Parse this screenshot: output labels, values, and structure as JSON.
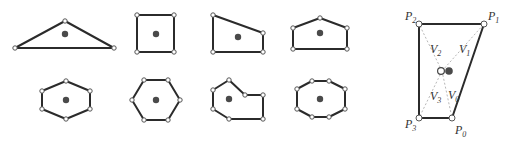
{
  "colors": {
    "edge": "#2b2b2b",
    "vertex_fill": "#ffffff",
    "vertex_stroke": "#555555",
    "centroid": "#4a4a4a",
    "diagonal": "#b8b8b8"
  },
  "shapes": [
    {
      "name": "triangle",
      "points": [
        [
          15,
          48
        ],
        [
          65,
          21
        ],
        [
          114,
          48
        ]
      ],
      "centroid": [
        65,
        34
      ]
    },
    {
      "name": "square",
      "points": [
        [
          137,
          15
        ],
        [
          174,
          15
        ],
        [
          174,
          52
        ],
        [
          137,
          52
        ]
      ],
      "centroid": [
        156,
        34
      ]
    },
    {
      "name": "quadrilateral",
      "points": [
        [
          213,
          15
        ],
        [
          263,
          33
        ],
        [
          263,
          52
        ],
        [
          213,
          52
        ]
      ],
      "centroid": [
        238,
        37
      ]
    },
    {
      "name": "pentagon",
      "points": [
        [
          293,
          28
        ],
        [
          320,
          18
        ],
        [
          347,
          28
        ],
        [
          347,
          49
        ],
        [
          293,
          49
        ]
      ],
      "centroid": [
        320,
        33
      ]
    },
    {
      "name": "hexagon-flat",
      "points": [
        [
          66,
          81
        ],
        [
          90,
          91
        ],
        [
          90,
          109
        ],
        [
          66,
          119
        ],
        [
          42,
          109
        ],
        [
          42,
          91
        ]
      ],
      "centroid": [
        66,
        100
      ]
    },
    {
      "name": "hexagon-regular",
      "points": [
        [
          144,
          80
        ],
        [
          168,
          80
        ],
        [
          180,
          100
        ],
        [
          168,
          120
        ],
        [
          144,
          120
        ],
        [
          132,
          100
        ]
      ],
      "centroid": [
        156,
        100
      ]
    },
    {
      "name": "concave-heptagon",
      "points": [
        [
          213,
          90
        ],
        [
          229,
          80
        ],
        [
          245,
          95
        ],
        [
          263,
          95
        ],
        [
          263,
          119
        ],
        [
          229,
          119
        ],
        [
          213,
          109
        ]
      ],
      "centroid": [
        229,
        99
      ]
    },
    {
      "name": "octagon",
      "points": [
        [
          312,
          81
        ],
        [
          329,
          81
        ],
        [
          345,
          89
        ],
        [
          345,
          109
        ],
        [
          329,
          117
        ],
        [
          312,
          117
        ],
        [
          297,
          109
        ],
        [
          297,
          89
        ]
      ],
      "centroid": [
        320,
        99
      ]
    }
  ],
  "detail": {
    "points": {
      "P0": [
        452,
        118
      ],
      "P1": [
        484,
        24
      ],
      "P2": [
        419,
        24
      ],
      "P3": [
        419,
        118
      ]
    },
    "origin": [
      439,
      71
    ],
    "centroid": [
      449,
      71
    ],
    "labels": [
      {
        "base": "P",
        "sub": "2",
        "x": 405,
        "y": 20
      },
      {
        "base": "P",
        "sub": "1",
        "x": 488,
        "y": 20
      },
      {
        "base": "P",
        "sub": "3",
        "x": 405,
        "y": 128
      },
      {
        "base": "P",
        "sub": "0",
        "x": 455,
        "y": 134
      },
      {
        "base": "V",
        "sub": "2",
        "x": 430,
        "y": 53
      },
      {
        "base": "V",
        "sub": "1",
        "x": 459,
        "y": 53
      },
      {
        "base": "V",
        "sub": "3",
        "x": 430,
        "y": 100
      },
      {
        "base": "V",
        "sub": "0",
        "x": 448,
        "y": 99
      },
      {
        "base": "O",
        "sub": "",
        "x": 432,
        "y": 75
      }
    ]
  }
}
